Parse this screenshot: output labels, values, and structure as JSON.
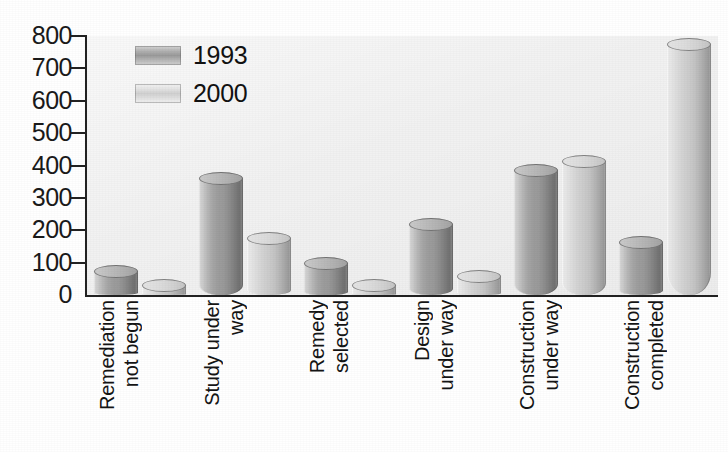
{
  "chart_data": {
    "type": "bar",
    "title": "",
    "xlabel": "",
    "ylabel": "",
    "ylim": [
      0,
      800
    ],
    "ytick_step": 100,
    "yticks": [
      800,
      700,
      600,
      500,
      400,
      300,
      200,
      100,
      0
    ],
    "grid": false,
    "legend_position": "top-left",
    "categories": [
      "Remediation not begun",
      "Study under way",
      "Remedy selected",
      "Design under way",
      "Construction under way",
      "Construction completed"
    ],
    "category_lines": [
      [
        "Remediation",
        "not begun"
      ],
      [
        "Study under",
        "way"
      ],
      [
        "Remedy",
        "selected"
      ],
      [
        "Design",
        "under way"
      ],
      [
        "Construction",
        "under way"
      ],
      [
        "Construction",
        "completed"
      ]
    ],
    "series": [
      {
        "name": "1993",
        "color": "#9a9a9a",
        "values": [
          75,
          360,
          100,
          220,
          385,
          165
        ]
      },
      {
        "name": "2000",
        "color": "#d2d2d2",
        "values": [
          30,
          175,
          30,
          60,
          415,
          775
        ]
      }
    ]
  },
  "legend": {
    "items": [
      {
        "label": "1993"
      },
      {
        "label": "2000"
      }
    ]
  },
  "axis": {
    "y_labels": [
      "800",
      "700",
      "600",
      "500",
      "400",
      "300",
      "200",
      "100",
      "0"
    ]
  },
  "style": {
    "plot_background": "#f1f1f1",
    "page_background": "#ffffff",
    "axis_color": "#222222",
    "text_color": "#141414"
  }
}
